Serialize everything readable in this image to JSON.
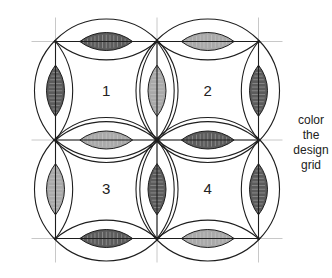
{
  "diagram": {
    "caption_lines": [
      "color",
      "the",
      "design",
      "grid"
    ],
    "grid": {
      "xs": [
        55.5,
        157,
        258.5
      ],
      "ys": [
        41.5,
        140,
        238.5
      ],
      "guide_color": "#c8c8c8",
      "line_color": "#1e1e1e"
    },
    "colors": {
      "dark_melon": "#5c5c5c",
      "light_melon": "#a9a9a9",
      "stitch": "#e6e6e6"
    },
    "blocks": [
      {
        "label": "1",
        "col": 0,
        "row": 0
      },
      {
        "label": "2",
        "col": 1,
        "row": 0
      },
      {
        "label": "3",
        "col": 0,
        "row": 1
      },
      {
        "label": "4",
        "col": 1,
        "row": 1
      }
    ],
    "melons": [
      {
        "edge": "h",
        "col": 0,
        "row": 0,
        "shade": "dark"
      },
      {
        "edge": "h",
        "col": 1,
        "row": 0,
        "shade": "light"
      },
      {
        "edge": "h",
        "col": 0,
        "row": 1,
        "shade": "light"
      },
      {
        "edge": "h",
        "col": 1,
        "row": 1,
        "shade": "dark"
      },
      {
        "edge": "h",
        "col": 0,
        "row": 2,
        "shade": "dark"
      },
      {
        "edge": "h",
        "col": 1,
        "row": 2,
        "shade": "light"
      },
      {
        "edge": "v",
        "col": 0,
        "row": 0,
        "shade": "dark"
      },
      {
        "edge": "v",
        "col": 1,
        "row": 0,
        "shade": "light"
      },
      {
        "edge": "v",
        "col": 2,
        "row": 0,
        "shade": "dark"
      },
      {
        "edge": "v",
        "col": 0,
        "row": 1,
        "shade": "light"
      },
      {
        "edge": "v",
        "col": 1,
        "row": 1,
        "shade": "dark"
      },
      {
        "edge": "v",
        "col": 2,
        "row": 1,
        "shade": "dark"
      }
    ]
  }
}
